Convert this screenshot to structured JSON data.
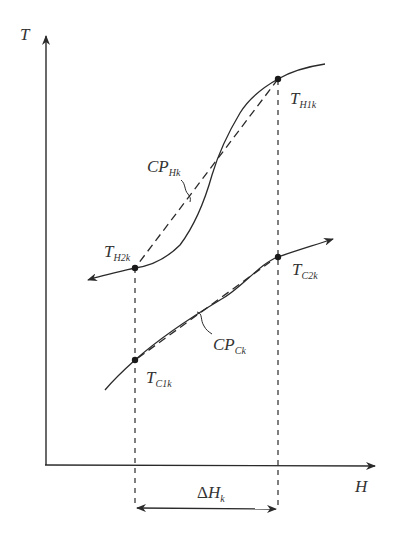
{
  "diagram": {
    "title": "",
    "axes": {
      "y_label": "T",
      "x_label": "H"
    },
    "hot_stream": {
      "label_main": "CP",
      "label_sub": "Hk",
      "points": [
        {
          "name": "T_H1k",
          "main": "T",
          "sub": "H1k"
        },
        {
          "name": "T_H2k",
          "main": "T",
          "sub": "H2k"
        }
      ]
    },
    "cold_stream": {
      "label_main": "CP",
      "label_sub": "Ck",
      "points": [
        {
          "name": "T_C1k",
          "main": "T",
          "sub": "C1k"
        },
        {
          "name": "T_C2k",
          "main": "T",
          "sub": "C2k"
        }
      ]
    },
    "interval": {
      "delta": "Δ",
      "main": "H",
      "sub": "k"
    },
    "colors": {
      "line": "#2a2a2a",
      "text": "#333333",
      "background": "#ffffff"
    }
  }
}
